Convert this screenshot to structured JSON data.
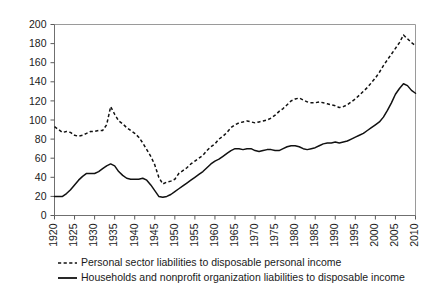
{
  "chart_data": {
    "type": "line",
    "title": "",
    "subtitle": "",
    "xlabel": "",
    "ylabel": "",
    "xlim": [
      1920,
      2010
    ],
    "ylim": [
      0,
      200
    ],
    "grid": false,
    "legend_position": "below",
    "xticks": [
      "1920",
      "1925",
      "1930",
      "1935",
      "1940",
      "1945",
      "1950",
      "1955",
      "1960",
      "1965",
      "1970",
      "1975",
      "1980",
      "1985",
      "1990",
      "1995",
      "2000",
      "2005",
      "2010"
    ],
    "yticks": [
      "0",
      "20",
      "40",
      "60",
      "80",
      "100",
      "120",
      "140",
      "160",
      "180",
      "200"
    ],
    "x": [
      1920,
      1921,
      1922,
      1923,
      1924,
      1925,
      1926,
      1927,
      1928,
      1929,
      1930,
      1931,
      1932,
      1933,
      1934,
      1935,
      1936,
      1937,
      1938,
      1939,
      1940,
      1941,
      1942,
      1943,
      1944,
      1945,
      1946,
      1947,
      1948,
      1949,
      1950,
      1951,
      1952,
      1953,
      1954,
      1955,
      1956,
      1957,
      1958,
      1959,
      1960,
      1961,
      1962,
      1963,
      1964,
      1965,
      1966,
      1967,
      1968,
      1969,
      1970,
      1971,
      1972,
      1973,
      1974,
      1975,
      1976,
      1977,
      1978,
      1979,
      1980,
      1981,
      1982,
      1983,
      1984,
      1985,
      1986,
      1987,
      1988,
      1989,
      1990,
      1991,
      1992,
      1993,
      1994,
      1995,
      1996,
      1997,
      1998,
      1999,
      2000,
      2001,
      2002,
      2003,
      2004,
      2005,
      2006,
      2007,
      2008,
      2009,
      2010
    ],
    "series": [
      {
        "name": "Personal sector liabilities to disposable personal income",
        "style": "dashed",
        "color": "#111111",
        "values": [
          93,
          90,
          87,
          88,
          87,
          84,
          83,
          84,
          86,
          88,
          88,
          89,
          89,
          95,
          114,
          106,
          99,
          96,
          92,
          89,
          86,
          82,
          76,
          69,
          62,
          53,
          40,
          33,
          35,
          36,
          38,
          44,
          47,
          50,
          54,
          57,
          60,
          63,
          68,
          72,
          75,
          80,
          83,
          87,
          92,
          95,
          97,
          98,
          99,
          98,
          97,
          98,
          99,
          100,
          102,
          105,
          109,
          112,
          116,
          120,
          122,
          123,
          121,
          119,
          118,
          118,
          119,
          118,
          117,
          116,
          115,
          113,
          114,
          116,
          119,
          122,
          126,
          130,
          134,
          139,
          144,
          150,
          157,
          163,
          169,
          175,
          181,
          189,
          185,
          181,
          178
        ]
      },
      {
        "name": "Households and nonprofit organization liabilities to disposable income",
        "style": "solid",
        "color": "#111111",
        "values": [
          20,
          20,
          20,
          23,
          27,
          32,
          37,
          41,
          44,
          44,
          44,
          46,
          49,
          52,
          54,
          52,
          46,
          42,
          39,
          38,
          38,
          38,
          39,
          37,
          32,
          26,
          20,
          19,
          20,
          22,
          25,
          28,
          31,
          34,
          37,
          40,
          43,
          46,
          50,
          54,
          57,
          59,
          62,
          65,
          68,
          70,
          70,
          69,
          70,
          70,
          68,
          67,
          68,
          69,
          69,
          68,
          68,
          70,
          72,
          73,
          73,
          72,
          70,
          69,
          70,
          71,
          73,
          75,
          76,
          76,
          77,
          76,
          77,
          78,
          80,
          82,
          84,
          86,
          89,
          92,
          95,
          98,
          103,
          110,
          118,
          127,
          133,
          138,
          136,
          131,
          128
        ]
      }
    ],
    "legend": [
      {
        "label": "Personal sector liabilities to disposable personal income",
        "style": "dashed"
      },
      {
        "label": "Households and nonprofit organization liabilities to disposable income",
        "style": "solid"
      }
    ]
  }
}
